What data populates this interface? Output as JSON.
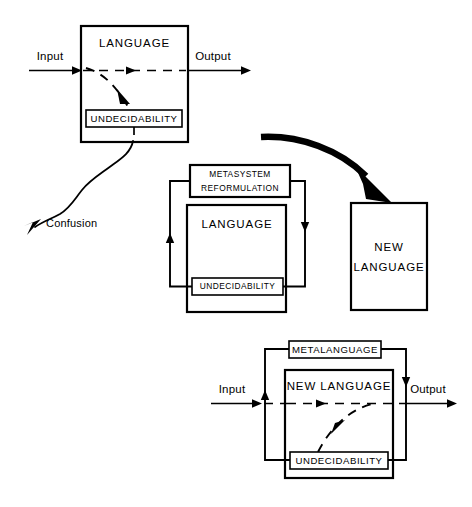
{
  "figure": {
    "background_color": "#ffffff",
    "line_color": "#000000"
  },
  "stage_one": {
    "name": "Original language with undecidability",
    "language_box_label": "LANGUAGE",
    "undecidability_box_label": "UNDECIDABILITY",
    "input_label": "Input",
    "output_label": "Output",
    "confusion_label": "Confusion"
  },
  "stage_two": {
    "name": "Metasystem reformulation loop",
    "metasystem_label_line1": "METASYSTEM",
    "metasystem_label_line2": "REFORMULATION",
    "language_box_label": "LANGUAGE",
    "undecidability_box_label": "UNDECIDABILITY",
    "result_box_label_line1": "NEW",
    "result_box_label_line2": "LANGUAGE"
  },
  "stage_three": {
    "name": "New language with metalanguage feedback",
    "metalanguage_box_label": "METALANGUAGE",
    "language_box_label": "NEW  LANGUAGE",
    "undecidability_box_label": "UNDECIDABILITY",
    "input_label": "Input",
    "output_label": "Output"
  }
}
